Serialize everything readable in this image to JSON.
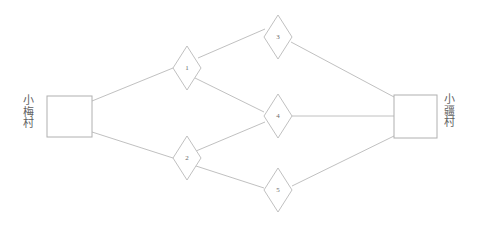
{
  "diagram": {
    "type": "network-graph",
    "background_color": "#ffffff",
    "stroke_color": "#b9b9b9",
    "text_color": "#5f5f5f",
    "terminals": [
      {
        "id": "left-village",
        "label": "小梅村",
        "label_orientation": "vertical",
        "shape": "square",
        "x": 47,
        "y": 96,
        "w": 45,
        "h": 41
      },
      {
        "id": "right-village",
        "label": "小疆村",
        "label_orientation": "vertical",
        "shape": "square",
        "x": 394,
        "y": 95,
        "w": 43,
        "h": 43
      }
    ],
    "nodes": [
      {
        "id": "n1",
        "label": "1",
        "shape": "diamond",
        "cx": 187,
        "cy": 68,
        "rx": 14,
        "ry": 22
      },
      {
        "id": "n2",
        "label": "2",
        "shape": "diamond",
        "cx": 187,
        "cy": 158,
        "rx": 14,
        "ry": 22
      },
      {
        "id": "n3",
        "label": "3",
        "shape": "diamond",
        "cx": 278,
        "cy": 37,
        "rx": 14,
        "ry": 22
      },
      {
        "id": "n4",
        "label": "4",
        "shape": "diamond",
        "cx": 278,
        "cy": 116,
        "rx": 14,
        "ry": 22
      },
      {
        "id": "n5",
        "label": "5",
        "shape": "diamond",
        "cx": 278,
        "cy": 190,
        "rx": 14,
        "ry": 22
      }
    ],
    "edges": [
      {
        "id": "e-left-n1",
        "from": "left-village",
        "to": "n1",
        "x1": 92,
        "y1": 101,
        "x2": 173,
        "y2": 68
      },
      {
        "id": "e-left-n2",
        "from": "left-village",
        "to": "n2",
        "x1": 92,
        "y1": 132,
        "x2": 173,
        "y2": 158
      },
      {
        "id": "e-n1-n3",
        "from": "n1",
        "to": "n3",
        "x1": 198,
        "y1": 58,
        "x2": 265,
        "y2": 29
      },
      {
        "id": "e-n1-n4",
        "from": "n1",
        "to": "n4",
        "x1": 195,
        "y1": 78,
        "x2": 264,
        "y2": 112
      },
      {
        "id": "e-n2-n4",
        "from": "n2",
        "to": "n4",
        "x1": 196,
        "y1": 151,
        "x2": 265,
        "y2": 122
      },
      {
        "id": "e-n2-n5",
        "from": "n2",
        "to": "n5",
        "x1": 196,
        "y1": 166,
        "x2": 264,
        "y2": 188
      },
      {
        "id": "e-n3-right",
        "from": "n3",
        "to": "right-village",
        "x1": 291,
        "y1": 42,
        "x2": 394,
        "y2": 97
      },
      {
        "id": "e-n4-right",
        "from": "n4",
        "to": "right-village",
        "x1": 292,
        "y1": 116,
        "x2": 394,
        "y2": 116
      },
      {
        "id": "e-n5-right",
        "from": "n5",
        "to": "right-village",
        "x1": 292,
        "y1": 186,
        "x2": 394,
        "y2": 136
      }
    ]
  }
}
